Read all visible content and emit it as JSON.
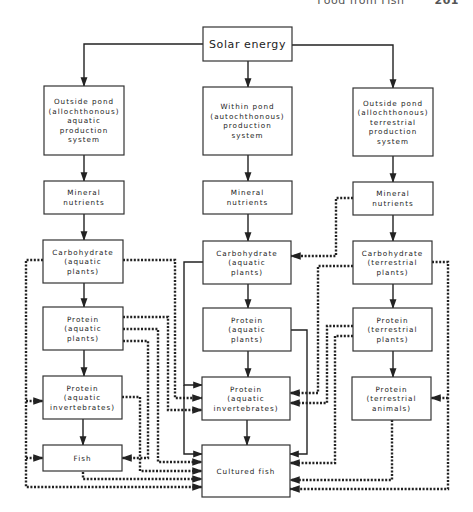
{
  "header": {
    "running_title": "Food from Fish",
    "page_number": "201"
  },
  "nodes": [
    {
      "id": "solar",
      "x": 203,
      "y": 27,
      "w": 89,
      "h": 34,
      "lines": [
        "Solar energy"
      ],
      "big": true
    },
    {
      "id": "out_aq",
      "x": 44,
      "y": 86,
      "w": 80,
      "h": 69,
      "lines": [
        "Outside pond",
        "(allochthonous)",
        "aquatic",
        "production",
        "system"
      ]
    },
    {
      "id": "within",
      "x": 203,
      "y": 87,
      "w": 89,
      "h": 68,
      "lines": [
        "Within pond",
        "(autochthonous)",
        "production",
        "system"
      ]
    },
    {
      "id": "out_ter",
      "x": 353,
      "y": 88,
      "w": 80,
      "h": 68,
      "lines": [
        "Outside pond",
        "(allochthonous)",
        "terrestrial",
        "production",
        "system"
      ]
    },
    {
      "id": "min_l",
      "x": 44,
      "y": 181,
      "w": 80,
      "h": 33,
      "lines": [
        "Mineral",
        "nutrients"
      ]
    },
    {
      "id": "min_m",
      "x": 203,
      "y": 181,
      "w": 89,
      "h": 33,
      "lines": [
        "Mineral",
        "nutrients"
      ]
    },
    {
      "id": "min_r",
      "x": 353,
      "y": 182,
      "w": 80,
      "h": 33,
      "lines": [
        "Mineral",
        "nutrients"
      ]
    },
    {
      "id": "carb_l",
      "x": 43,
      "y": 240,
      "w": 80,
      "h": 43,
      "lines": [
        "Carbohydrate",
        "(aquatic",
        "plants)"
      ]
    },
    {
      "id": "carb_m",
      "x": 203,
      "y": 241,
      "w": 88,
      "h": 43,
      "lines": [
        "Carbohydrate",
        "(aquatic",
        "plants)"
      ]
    },
    {
      "id": "carb_r",
      "x": 353,
      "y": 241,
      "w": 79,
      "h": 43,
      "lines": [
        "Carbohydrate",
        "(terrestrial",
        "plants)"
      ]
    },
    {
      "id": "prot_l",
      "x": 43,
      "y": 307,
      "w": 80,
      "h": 43,
      "lines": [
        "Protein",
        "(aquatic",
        "plants)"
      ]
    },
    {
      "id": "prot_m",
      "x": 203,
      "y": 308,
      "w": 88,
      "h": 43,
      "lines": [
        "Protein",
        "(aquatic",
        "plants)"
      ]
    },
    {
      "id": "prot_r",
      "x": 353,
      "y": 308,
      "w": 79,
      "h": 43,
      "lines": [
        "Protein",
        "(terrestrial",
        "plants)"
      ]
    },
    {
      "id": "inv_l",
      "x": 43,
      "y": 376,
      "w": 79,
      "h": 43,
      "lines": [
        "Protein",
        "(aquatic",
        "invertebrates)"
      ]
    },
    {
      "id": "inv_m",
      "x": 202,
      "y": 377,
      "w": 88,
      "h": 43,
      "lines": [
        "Protein",
        "(aquatic",
        "invertebrates)"
      ]
    },
    {
      "id": "ani_r",
      "x": 352,
      "y": 377,
      "w": 79,
      "h": 43,
      "lines": [
        "Protein",
        "(terrestrial",
        "animals)"
      ]
    },
    {
      "id": "fish_l",
      "x": 43,
      "y": 445,
      "w": 79,
      "h": 26,
      "lines": [
        "Fish"
      ]
    },
    {
      "id": "cult",
      "x": 202,
      "y": 445,
      "w": 88,
      "h": 52,
      "lines": [
        "Cultured fish"
      ]
    }
  ],
  "edges_solid": [
    {
      "from": "solar",
      "to": "out_aq",
      "pts": [
        [
          203,
          44
        ],
        [
          84,
          44
        ],
        [
          84,
          86
        ]
      ]
    },
    {
      "from": "solar",
      "to": "within",
      "pts": [
        [
          248,
          61
        ],
        [
          248,
          87
        ]
      ]
    },
    {
      "from": "solar",
      "to": "out_ter",
      "pts": [
        [
          292,
          45
        ],
        [
          393,
          45
        ],
        [
          393,
          88
        ]
      ]
    },
    {
      "from": "out_aq",
      "to": "min_l",
      "pts": [
        [
          84,
          155
        ],
        [
          84,
          181
        ]
      ]
    },
    {
      "from": "within",
      "to": "min_m",
      "pts": [
        [
          248,
          155
        ],
        [
          248,
          181
        ]
      ]
    },
    {
      "from": "out_ter",
      "to": "min_r",
      "pts": [
        [
          393,
          156
        ],
        [
          393,
          182
        ]
      ]
    },
    {
      "from": "min_l",
      "to": "carb_l",
      "pts": [
        [
          84,
          214
        ],
        [
          84,
          240
        ]
      ]
    },
    {
      "from": "min_m",
      "to": "carb_m",
      "pts": [
        [
          248,
          214
        ],
        [
          248,
          241
        ]
      ]
    },
    {
      "from": "min_r",
      "to": "carb_r",
      "pts": [
        [
          393,
          215
        ],
        [
          393,
          241
        ]
      ]
    },
    {
      "from": "carb_l",
      "to": "prot_l",
      "pts": [
        [
          84,
          283
        ],
        [
          84,
          307
        ]
      ]
    },
    {
      "from": "carb_m",
      "to": "prot_m",
      "pts": [
        [
          248,
          284
        ],
        [
          248,
          308
        ]
      ]
    },
    {
      "from": "carb_r",
      "to": "prot_r",
      "pts": [
        [
          393,
          284
        ],
        [
          393,
          308
        ]
      ]
    },
    {
      "from": "prot_l",
      "to": "inv_l",
      "pts": [
        [
          84,
          350
        ],
        [
          84,
          376
        ]
      ]
    },
    {
      "from": "prot_m",
      "to": "inv_m",
      "pts": [
        [
          248,
          351
        ],
        [
          248,
          377
        ]
      ]
    },
    {
      "from": "prot_r",
      "to": "ani_r",
      "pts": [
        [
          393,
          351
        ],
        [
          393,
          377
        ]
      ]
    },
    {
      "from": "inv_l",
      "to": "fish_l",
      "pts": [
        [
          83,
          419
        ],
        [
          83,
          445
        ]
      ]
    },
    {
      "from": "inv_m",
      "to": "cult",
      "pts": [
        [
          247,
          420
        ],
        [
          247,
          445
        ]
      ]
    },
    {
      "from": "carb_m",
      "to": "inv_m",
      "pts": [
        [
          203,
          262
        ],
        [
          184,
          262
        ],
        [
          184,
          385
        ],
        [
          202,
          385
        ]
      ]
    },
    {
      "from": "carb_m",
      "to": "cult",
      "pts": [
        [
          184,
          385
        ],
        [
          184,
          454
        ],
        [
          202,
          454
        ]
      ]
    },
    {
      "from": "prot_m",
      "to": "cult",
      "pts": [
        [
          291,
          330
        ],
        [
          307,
          330
        ],
        [
          307,
          454
        ],
        [
          290,
          454
        ]
      ]
    }
  ],
  "edges_dotted": [
    {
      "from": "carb_l",
      "to": "inv_l,fish_l,cult",
      "pts": [
        [
          43,
          260
        ],
        [
          26,
          260
        ],
        [
          26,
          487
        ],
        [
          202,
          487
        ]
      ]
    },
    {
      "from": "carb_l",
      "to": "inv_l",
      "pts": [
        [
          26,
          401
        ],
        [
          43,
          401
        ]
      ]
    },
    {
      "from": "carb_l",
      "to": "fish_l",
      "pts": [
        [
          26,
          458
        ],
        [
          43,
          458
        ]
      ]
    },
    {
      "from": "carb_l",
      "to": "inv_m",
      "pts": [
        [
          123,
          260
        ],
        [
          175,
          260
        ],
        [
          175,
          398
        ],
        [
          202,
          398
        ]
      ]
    },
    {
      "from": "prot_l",
      "to": "inv_m",
      "pts": [
        [
          123,
          317
        ],
        [
          168,
          317
        ],
        [
          168,
          410
        ],
        [
          202,
          410
        ]
      ]
    },
    {
      "from": "prot_l",
      "to": "cult",
      "pts": [
        [
          123,
          329
        ],
        [
          158,
          329
        ],
        [
          158,
          462
        ],
        [
          202,
          462
        ]
      ]
    },
    {
      "from": "prot_l",
      "to": "fish_l",
      "pts": [
        [
          123,
          341
        ],
        [
          148,
          341
        ],
        [
          148,
          458
        ],
        [
          122,
          458
        ]
      ]
    },
    {
      "from": "inv_l",
      "to": "cult",
      "pts": [
        [
          122,
          397
        ],
        [
          140,
          397
        ],
        [
          140,
          471
        ],
        [
          202,
          471
        ]
      ]
    },
    {
      "from": "fish_l",
      "to": "cult",
      "pts": [
        [
          83,
          472
        ],
        [
          83,
          479
        ],
        [
          202,
          479
        ]
      ]
    },
    {
      "from": "min_r",
      "to": "carb_m",
      "pts": [
        [
          353,
          198
        ],
        [
          336,
          198
        ],
        [
          336,
          256
        ],
        [
          291,
          256
        ]
      ]
    },
    {
      "from": "carb_r",
      "to": "inv_m",
      "pts": [
        [
          353,
          266
        ],
        [
          318,
          266
        ],
        [
          318,
          393
        ],
        [
          290,
          393
        ]
      ]
    },
    {
      "from": "prot_r",
      "to": "inv_m",
      "pts": [
        [
          353,
          326
        ],
        [
          327,
          326
        ],
        [
          327,
          403
        ],
        [
          290,
          403
        ]
      ]
    },
    {
      "from": "prot_r",
      "to": "cult",
      "pts": [
        [
          353,
          336
        ],
        [
          335,
          336
        ],
        [
          335,
          463
        ],
        [
          290,
          463
        ]
      ]
    },
    {
      "from": "carb_r",
      "to": "ani_r,cult",
      "pts": [
        [
          432,
          262
        ],
        [
          448,
          262
        ],
        [
          448,
          489
        ],
        [
          290,
          489
        ]
      ]
    },
    {
      "from": "carb_r",
      "to": "ani_r",
      "pts": [
        [
          448,
          398
        ],
        [
          431,
          398
        ]
      ]
    },
    {
      "from": "ani_r",
      "to": "cult",
      "pts": [
        [
          392,
          420
        ],
        [
          392,
          480
        ],
        [
          290,
          480
        ]
      ]
    }
  ]
}
